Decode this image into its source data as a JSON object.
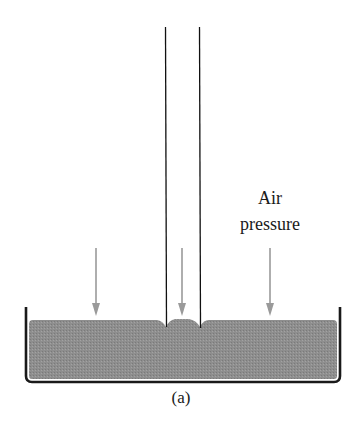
{
  "figure": {
    "caption": "(a)",
    "labels": {
      "air_line1": "Air",
      "air_line2": "pressure"
    },
    "colors": {
      "liquid": "#8c8c8c",
      "container": "#1a1a1a",
      "tube": "#111111",
      "arrow": "#9a9a9a"
    },
    "arrows": [
      {
        "x": 96,
        "y1": 248,
        "y2": 316
      },
      {
        "x": 182,
        "y1": 248,
        "y2": 316
      },
      {
        "x": 270,
        "y1": 248,
        "y2": 316
      }
    ]
  }
}
